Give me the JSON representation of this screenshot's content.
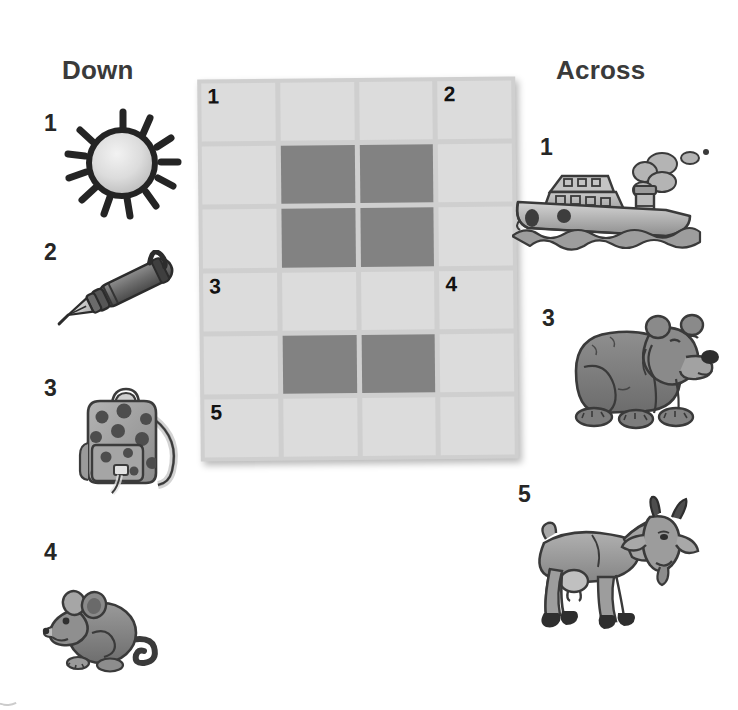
{
  "worksheet": {
    "type": "picture-crossword-puzzle",
    "background_color": "#ffffff"
  },
  "headings": {
    "down": "Down",
    "across": "Across"
  },
  "colors": {
    "cell_light": "#dcdcdc",
    "cell_dark": "#828282",
    "grid_border": "#cfcfcf",
    "number_text": "#121212",
    "heading_text": "#3a3a3a"
  },
  "grid": {
    "columns": 4,
    "rows": 6,
    "cells": [
      [
        {
          "state": "open",
          "number": "1"
        },
        {
          "state": "open",
          "number": ""
        },
        {
          "state": "open",
          "number": ""
        },
        {
          "state": "open",
          "number": "2"
        }
      ],
      [
        {
          "state": "open",
          "number": ""
        },
        {
          "state": "blocked",
          "number": ""
        },
        {
          "state": "blocked",
          "number": ""
        },
        {
          "state": "open",
          "number": ""
        }
      ],
      [
        {
          "state": "open",
          "number": ""
        },
        {
          "state": "blocked",
          "number": ""
        },
        {
          "state": "blocked",
          "number": ""
        },
        {
          "state": "open",
          "number": ""
        }
      ],
      [
        {
          "state": "open",
          "number": "3"
        },
        {
          "state": "open",
          "number": ""
        },
        {
          "state": "open",
          "number": ""
        },
        {
          "state": "open",
          "number": "4"
        }
      ],
      [
        {
          "state": "open",
          "number": ""
        },
        {
          "state": "blocked",
          "number": ""
        },
        {
          "state": "blocked",
          "number": ""
        },
        {
          "state": "open",
          "number": ""
        }
      ],
      [
        {
          "state": "open",
          "number": "5"
        },
        {
          "state": "open",
          "number": ""
        },
        {
          "state": "open",
          "number": ""
        },
        {
          "state": "open",
          "number": ""
        }
      ]
    ]
  },
  "clues": {
    "down": [
      {
        "number": "1",
        "picture": "sun-illustration",
        "subject": "sun"
      },
      {
        "number": "2",
        "picture": "pen-illustration",
        "subject": "pen"
      },
      {
        "number": "3",
        "picture": "backpack-illustration",
        "subject": "bag"
      },
      {
        "number": "4",
        "picture": "mouse-illustration",
        "subject": "rat"
      }
    ],
    "across": [
      {
        "number": "1",
        "picture": "boat-illustration",
        "subject": "boat"
      },
      {
        "number": "3",
        "picture": "bear-illustration",
        "subject": "bear"
      },
      {
        "number": "5",
        "picture": "goat-illustration",
        "subject": "goat"
      }
    ]
  }
}
